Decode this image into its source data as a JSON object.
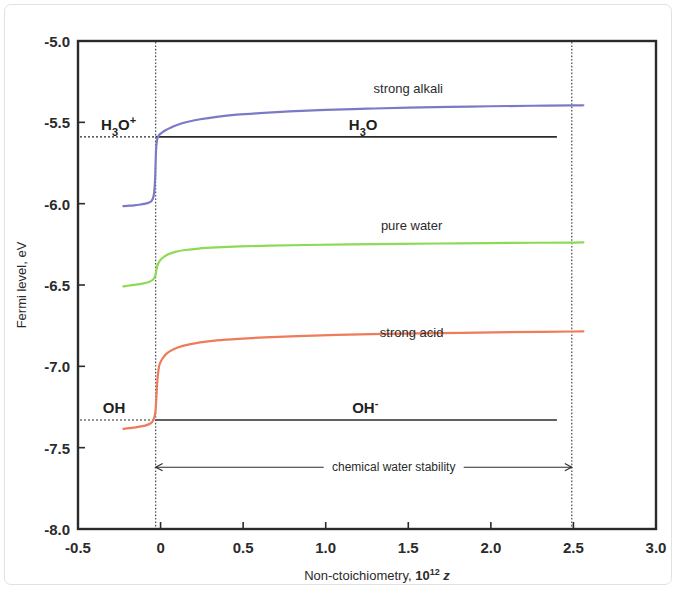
{
  "figure": {
    "background": "#ffffff",
    "frame_color": "#2b2b2b"
  },
  "chart_data": {
    "type": "line",
    "title": "",
    "xlabel": "Non-ctoichiometry, 10^12 z",
    "xlabel_text": "Non-ctoichiometry, ",
    "xlabel_mantissa": "10",
    "xlabel_exponent": "12",
    "xlabel_var": "z",
    "ylabel": "Fermi level, eV",
    "xlim": [
      -0.5,
      3.0
    ],
    "ylim": [
      -8.0,
      -5.0
    ],
    "xticks": [
      "-0.5",
      "0",
      "0.5",
      "1.0",
      "1.5",
      "2.0",
      "2.5",
      "3.0"
    ],
    "xtick_values": [
      -0.5,
      0,
      0.5,
      1.0,
      1.5,
      2.0,
      2.5,
      3.0
    ],
    "yticks": [
      "-5.0",
      "-5.5",
      "-6.0",
      "-6.5",
      "-7.0",
      "-7.5",
      "-8.0"
    ],
    "ytick_values": [
      -5.0,
      -5.5,
      -6.0,
      -6.5,
      -7.0,
      -7.5,
      -8.0
    ],
    "grid": false,
    "legend_position": "inline-annotations",
    "series": [
      {
        "name": "strong alkali",
        "color": "#7b7ac6",
        "label_x": 1.5,
        "label_y": -5.32,
        "points": [
          [
            -0.225,
            -6.015
          ],
          [
            -0.2,
            -6.013
          ],
          [
            -0.16,
            -6.01
          ],
          [
            -0.12,
            -6.005
          ],
          [
            -0.09,
            -6.0
          ],
          [
            -0.07,
            -5.993
          ],
          [
            -0.055,
            -5.983
          ],
          [
            -0.046,
            -5.968
          ],
          [
            -0.04,
            -5.94
          ],
          [
            -0.036,
            -5.9
          ],
          [
            -0.033,
            -5.845
          ],
          [
            -0.031,
            -5.78
          ],
          [
            -0.029,
            -5.715
          ],
          [
            -0.027,
            -5.665
          ],
          [
            -0.024,
            -5.628
          ],
          [
            -0.02,
            -5.603
          ],
          [
            -0.014,
            -5.587
          ],
          [
            -0.005,
            -5.574
          ],
          [
            0.01,
            -5.562
          ],
          [
            0.03,
            -5.549
          ],
          [
            0.06,
            -5.533
          ],
          [
            0.1,
            -5.516
          ],
          [
            0.16,
            -5.498
          ],
          [
            0.24,
            -5.481
          ],
          [
            0.34,
            -5.466
          ],
          [
            0.46,
            -5.453
          ],
          [
            0.6,
            -5.443
          ],
          [
            0.78,
            -5.433
          ],
          [
            1.0,
            -5.424
          ],
          [
            1.25,
            -5.416
          ],
          [
            1.5,
            -5.41
          ],
          [
            1.75,
            -5.405
          ],
          [
            2.0,
            -5.401
          ],
          [
            2.25,
            -5.398
          ],
          [
            2.5,
            -5.396
          ],
          [
            2.56,
            -5.395
          ]
        ]
      },
      {
        "name": "pure water",
        "color": "#8ed955",
        "label_x": 1.52,
        "label_y": -6.16,
        "points": [
          [
            -0.225,
            -6.508
          ],
          [
            -0.19,
            -6.503
          ],
          [
            -0.15,
            -6.498
          ],
          [
            -0.11,
            -6.492
          ],
          [
            -0.08,
            -6.485
          ],
          [
            -0.06,
            -6.476
          ],
          [
            -0.045,
            -6.466
          ],
          [
            -0.036,
            -6.452
          ],
          [
            -0.03,
            -6.434
          ],
          [
            -0.026,
            -6.412
          ],
          [
            -0.022,
            -6.391
          ],
          [
            -0.017,
            -6.374
          ],
          [
            -0.01,
            -6.36
          ],
          [
            0.0,
            -6.345
          ],
          [
            0.02,
            -6.327
          ],
          [
            0.05,
            -6.31
          ],
          [
            0.09,
            -6.296
          ],
          [
            0.15,
            -6.285
          ],
          [
            0.23,
            -6.276
          ],
          [
            0.34,
            -6.269
          ],
          [
            0.48,
            -6.263
          ],
          [
            0.66,
            -6.258
          ],
          [
            0.88,
            -6.254
          ],
          [
            1.15,
            -6.25
          ],
          [
            1.45,
            -6.247
          ],
          [
            1.8,
            -6.244
          ],
          [
            2.15,
            -6.241
          ],
          [
            2.5,
            -6.239
          ],
          [
            2.56,
            -6.238
          ]
        ]
      },
      {
        "name": "strong acid",
        "color": "#ee7b59",
        "label_x": 1.52,
        "label_y": -6.82,
        "points": [
          [
            -0.225,
            -7.385
          ],
          [
            -0.19,
            -7.38
          ],
          [
            -0.15,
            -7.375
          ],
          [
            -0.11,
            -7.368
          ],
          [
            -0.08,
            -7.36
          ],
          [
            -0.06,
            -7.35
          ],
          [
            -0.048,
            -7.338
          ],
          [
            -0.04,
            -7.322
          ],
          [
            -0.034,
            -7.298
          ],
          [
            -0.03,
            -7.265
          ],
          [
            -0.027,
            -7.22
          ],
          [
            -0.024,
            -7.165
          ],
          [
            -0.021,
            -7.11
          ],
          [
            -0.017,
            -7.06
          ],
          [
            -0.012,
            -7.018
          ],
          [
            -0.005,
            -6.985
          ],
          [
            0.01,
            -6.955
          ],
          [
            0.03,
            -6.928
          ],
          [
            0.06,
            -6.905
          ],
          [
            0.1,
            -6.886
          ],
          [
            0.16,
            -6.868
          ],
          [
            0.24,
            -6.853
          ],
          [
            0.34,
            -6.841
          ],
          [
            0.47,
            -6.831
          ],
          [
            0.63,
            -6.822
          ],
          [
            0.83,
            -6.814
          ],
          [
            1.07,
            -6.807
          ],
          [
            1.35,
            -6.801
          ],
          [
            1.67,
            -6.796
          ],
          [
            2.02,
            -6.791
          ],
          [
            2.3,
            -6.788
          ],
          [
            2.5,
            -6.786
          ],
          [
            2.56,
            -6.785
          ]
        ]
      }
    ],
    "reference_lines": [
      {
        "name": "H3O+ level",
        "value": -5.59,
        "color": "#2b2b2b",
        "x_from": -0.5,
        "x_to": 2.4,
        "left_label": {
          "base": "H",
          "sub": "3",
          "rest": "O",
          "sup": "+"
        },
        "right_label": {
          "base": "H",
          "sub": "3",
          "rest": "O",
          "sup": ""
        }
      },
      {
        "name": "OH- level",
        "value": -7.33,
        "color": "#2b2b2b",
        "x_from": -0.5,
        "x_to": 2.4,
        "left_label": {
          "base": "OH",
          "sub": "",
          "rest": "",
          "sup": ""
        },
        "right_label": {
          "base": "OH",
          "sub": "",
          "rest": "",
          "sup": "-"
        }
      }
    ],
    "vertical_markers": [
      {
        "name": "stoichiometry-zero-marker",
        "x": -0.03,
        "style": "dotted"
      },
      {
        "name": "stability-limit-marker",
        "x": 2.49,
        "style": "dotted"
      }
    ],
    "annotations": [
      {
        "name": "chemical-water-stability",
        "text": "chemical water stability",
        "y": -7.62,
        "x_from": -0.03,
        "x_to": 2.49
      }
    ]
  },
  "labels": {
    "h3o_plus_left": "H3O+",
    "h3o_right": "H3O",
    "oh_left": "OH",
    "oh_minus_right": "OH-",
    "stability": "chemical water stability",
    "strong_alkali": "strong alkali",
    "pure_water": "pure water",
    "strong_acid": "strong acid"
  }
}
